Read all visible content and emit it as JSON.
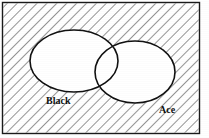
{
  "figure": {
    "type": "venn-diagram",
    "width": 209,
    "height": 138,
    "frame": {
      "stroke_color": "#1a1a1a",
      "stroke_width": 1.4,
      "x": 2.5,
      "y": 2.5,
      "width": 197,
      "height": 131
    },
    "background": {
      "fill_color": "#ffffff",
      "hatch": {
        "name": "diagonal-hatch",
        "direction": "backslash",
        "angle_deg": 45,
        "line_color": "#2b2b2b",
        "line_width": 1.0,
        "spacing": 7,
        "region": "outside-both-sets"
      }
    },
    "sets": [
      {
        "id": "black",
        "label": "Black",
        "shape": "ellipse",
        "cx": 74,
        "cy": 61,
        "rx": 44,
        "ry": 31,
        "fill_color": "#ffffff",
        "stroke_color": "#111111",
        "stroke_width": 1.6,
        "label_position": {
          "x": 46,
          "y": 104
        },
        "label_font_size": 10,
        "label_weight": "bold",
        "label_color": "#101010"
      },
      {
        "id": "ace",
        "label": "Ace",
        "shape": "ellipse",
        "cx": 135,
        "cy": 72,
        "rx": 40,
        "ry": 31,
        "fill_color": "#ffffff",
        "stroke_color": "#111111",
        "stroke_width": 1.6,
        "label_position": {
          "x": 159,
          "y": 113
        },
        "label_font_size": 10,
        "label_weight": "bold",
        "label_color": "#101010"
      }
    ],
    "regions": [
      {
        "id": "black-only",
        "description": "Black but not Ace",
        "shaded": false
      },
      {
        "id": "intersection",
        "description": "Black and Ace",
        "shaded": false
      },
      {
        "id": "ace-only",
        "description": "Ace but not Black",
        "shaded": false
      },
      {
        "id": "complement",
        "description": "Neither Black nor Ace",
        "shaded": true
      }
    ]
  }
}
